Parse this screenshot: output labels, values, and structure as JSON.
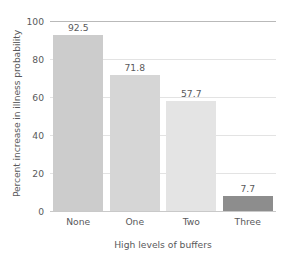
{
  "chart_data": {
    "type": "bar",
    "title": "",
    "xlabel": "High levels of buffers",
    "ylabel": "Percent increase in illness probability",
    "categories": [
      "None",
      "One",
      "Two",
      "Three"
    ],
    "values": [
      92.5,
      71.8,
      57.7,
      7.7
    ],
    "value_labels": [
      "92.5",
      "71.8",
      "57.7",
      "7.7"
    ],
    "bar_colors": [
      "#cccccc",
      "#d6d6d6",
      "#e4e4e4",
      "#8d8d8d"
    ],
    "ylim": [
      0,
      100
    ],
    "yticks": [
      0,
      20,
      40,
      60,
      80,
      100
    ],
    "ytick_labels": [
      "0",
      "20",
      "40",
      "60",
      "80",
      "100"
    ],
    "grid": "horizontal",
    "legend": "none",
    "axis_color": "#59595b",
    "gridline_color": "#e3e3e3",
    "background": "#ffffff"
  }
}
